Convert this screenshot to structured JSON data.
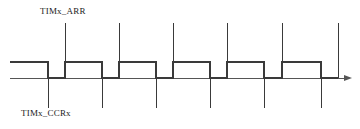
{
  "figure": {
    "type": "timing-diagram",
    "title": "",
    "background_color": "#ffffff",
    "line_color": "#3a3a3a",
    "axis_color": "#555555",
    "text_color": "#1a1a1a"
  },
  "labels": {
    "arr": "TIMx_ARR",
    "ccr": "TIMx_CCRx"
  },
  "chart_data": {
    "type": "line",
    "title": "",
    "xlabel": "",
    "ylabel": "",
    "levels": {
      "low": 0,
      "high": 1
    },
    "axis": {
      "baseline_y": 78,
      "high_y": 62,
      "x_start": 10,
      "x_end": 352,
      "arrow": true
    },
    "waveform_points": [
      {
        "x": 10,
        "level": 1
      },
      {
        "x": 48,
        "level": 1
      },
      {
        "x": 48,
        "level": 0
      },
      {
        "x": 65,
        "level": 0
      },
      {
        "x": 65,
        "level": 1
      },
      {
        "x": 102,
        "level": 1
      },
      {
        "x": 102,
        "level": 0
      },
      {
        "x": 119,
        "level": 0
      },
      {
        "x": 119,
        "level": 1
      },
      {
        "x": 156,
        "level": 1
      },
      {
        "x": 156,
        "level": 0
      },
      {
        "x": 173,
        "level": 0
      },
      {
        "x": 173,
        "level": 1
      },
      {
        "x": 210,
        "level": 1
      },
      {
        "x": 210,
        "level": 0
      },
      {
        "x": 227,
        "level": 0
      },
      {
        "x": 227,
        "level": 1
      },
      {
        "x": 264,
        "level": 1
      },
      {
        "x": 264,
        "level": 0
      },
      {
        "x": 282,
        "level": 0
      },
      {
        "x": 282,
        "level": 1
      },
      {
        "x": 321,
        "level": 1
      },
      {
        "x": 321,
        "level": 0
      },
      {
        "x": 338,
        "level": 0
      }
    ],
    "arr_markers": [
      65,
      119,
      173,
      227,
      282,
      338
    ],
    "ccr_markers": [
      48,
      102,
      156,
      210,
      264,
      321
    ],
    "marker_top_y": 23,
    "marker_bottom_y": 108,
    "period_px": 54,
    "duty_cycle_percent": 68
  }
}
